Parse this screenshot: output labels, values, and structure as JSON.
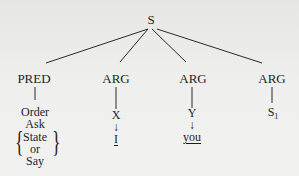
{
  "tree": {
    "root": {
      "label": "S"
    },
    "children": [
      {
        "label": "PRED",
        "leaves": [
          "Order",
          "Ask"
        ],
        "braced_options": [
          "State",
          "or",
          "Say"
        ]
      },
      {
        "label": "ARG",
        "variable": "X",
        "arrow": "↓",
        "value": "I",
        "value_underlined": true
      },
      {
        "label": "ARG",
        "variable": "Y",
        "arrow": "↓",
        "value": "you",
        "value_underlined": true
      },
      {
        "label": "ARG",
        "value": "S",
        "subscript": "1"
      }
    ]
  }
}
